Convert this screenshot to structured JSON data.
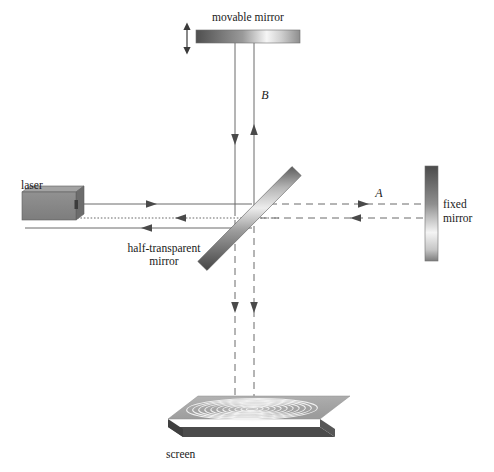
{
  "figure": {
    "background_color": "#ffffff",
    "line_color": "#555555",
    "text_color": "#1a1a1a"
  },
  "labels": {
    "movable_mirror": "movable mirror",
    "laser": "laser",
    "half_transparent_mirror_line1": "half-transparent",
    "half_transparent_mirror_line2": "mirror",
    "fixed_mirror_line1": "fixed",
    "fixed_mirror_line2": "mirror",
    "screen": "screen",
    "beam_a": "A",
    "beam_b": "B"
  },
  "components": {
    "movable_mirror": {
      "name": "movable mirror",
      "shape": "horizontal-bar",
      "x": 196,
      "y": 30,
      "width": 104,
      "height": 13,
      "gradient_from": "#585858",
      "gradient_to": "#f2f2f2",
      "adjust_arrow": {
        "x": 187,
        "y_top": 24,
        "y_bottom": 52,
        "double_headed": true
      }
    },
    "laser": {
      "name": "laser",
      "shape": "3d-box",
      "x": 22,
      "y": 192,
      "width": 55,
      "height": 28,
      "face_color": "#8a8a8a",
      "side_color": "#6d6d6d",
      "top_color": "#a5a5a5"
    },
    "beam_splitter": {
      "name": "half-transparent mirror",
      "shape": "diagonal-bar",
      "x1": 202,
      "y1": 266,
      "x2": 297,
      "y2": 172,
      "thickness": 13,
      "gradient_from": "#4a4a4a",
      "gradient_to": "#e6e6e6"
    },
    "fixed_mirror": {
      "name": "fixed mirror",
      "shape": "vertical-bar",
      "x": 425,
      "y": 166,
      "width": 13,
      "height": 95,
      "gradient_from": "#4f4f4f",
      "gradient_to": "#ededed"
    },
    "screen": {
      "name": "screen",
      "shape": "3d-slab-parallelogram",
      "top_color": "#a9a9a9",
      "front_color": "#4b4b4b",
      "ring_color": "#f2f2f2",
      "ring_count": 11,
      "center_x": 244,
      "center_y": 414
    }
  },
  "beams": {
    "laser_to_splitter": {
      "name": "outgoing laser beam",
      "style": "solid",
      "y": 204,
      "x_start": 77,
      "x_end": 252,
      "arrow_direction": "right",
      "arrow_x": 152
    },
    "returning_dotted": {
      "name": "returning combined beam (dotted)",
      "style": "dotted",
      "y": 218,
      "x_start": 77,
      "x_end": 280,
      "arrow_direction": "left",
      "arrow_x": 180
    },
    "returning_solid": {
      "name": "returning reflected beam (solid)",
      "style": "solid",
      "y": 228,
      "x_start": 25,
      "x_end": 252,
      "arrow_direction": "left",
      "arrow_x": 145
    },
    "splitter_to_fixed_out": {
      "name": "beam A toward fixed mirror",
      "style": "dashed",
      "y": 204,
      "x_start": 272,
      "x_end": 425,
      "arrow_direction": "right",
      "arrow_x": 368
    },
    "fixed_to_splitter_back": {
      "name": "beam A returning from fixed mirror",
      "style": "dashed",
      "y": 218,
      "x_start": 262,
      "x_end": 425,
      "arrow_direction": "left",
      "arrow_x": 355
    },
    "splitter_to_movable_up": {
      "name": "beam B toward movable mirror",
      "style": "solid",
      "x": 235,
      "y_start": 43,
      "y_end": 216,
      "arrow_direction": "down",
      "arrow_y": 145
    },
    "movable_to_splitter_down": {
      "name": "beam B returning from movable mirror",
      "style": "solid",
      "x": 254,
      "y_start": 43,
      "y_end": 222,
      "arrow_direction": "up",
      "arrow_y": 130
    },
    "splitter_to_screen_left": {
      "name": "combined beam to screen (left)",
      "style": "dashed",
      "x": 235,
      "y_start": 222,
      "y_end": 412,
      "arrow_direction": "down",
      "arrow_y": 313
    },
    "splitter_to_screen_right": {
      "name": "combined beam to screen (right)",
      "style": "dashed",
      "x": 254,
      "y_start": 228,
      "y_end": 412,
      "arrow_direction": "down",
      "arrow_y": 313
    }
  },
  "label_positions": {
    "movable_mirror": {
      "x": 248,
      "y": 21,
      "anchor": "middle"
    },
    "laser": {
      "x": 22,
      "y": 189,
      "anchor": "start"
    },
    "half_transparent_mirror": {
      "x": 163,
      "y": 254,
      "anchor": "middle"
    },
    "fixed_mirror": {
      "x": 443,
      "y": 207,
      "anchor": "start"
    },
    "screen": {
      "x": 166,
      "y": 458,
      "anchor": "start"
    },
    "beam_a": {
      "x": 379,
      "y": 196,
      "anchor": "middle"
    },
    "beam_b": {
      "x": 264,
      "y": 98,
      "anchor": "middle"
    }
  }
}
